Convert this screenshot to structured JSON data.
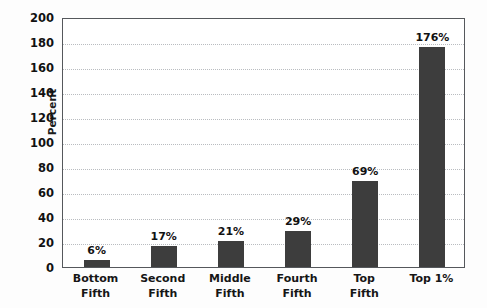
{
  "chart_data": {
    "type": "bar",
    "title": "",
    "subtitle": "",
    "xlabel": "",
    "ylabel": "Percent",
    "categories": [
      "Bottom Fifth",
      "Second Fifth",
      "Middle Fifth",
      "Fourth Fifth",
      "Top Fifth",
      "Top 1%"
    ],
    "category_lines": [
      [
        "Bottom",
        "Fifth"
      ],
      [
        "Second",
        "Fifth"
      ],
      [
        "Middle",
        "Fifth"
      ],
      [
        "Fourth",
        "Fifth"
      ],
      [
        "Top",
        "Fifth"
      ],
      [
        "Top 1%",
        ""
      ]
    ],
    "values": [
      6,
      17,
      21,
      29,
      69,
      176
    ],
    "value_labels": [
      "6%",
      "17%",
      "21%",
      "29%",
      "69%",
      "176%"
    ],
    "ylim": [
      0,
      200
    ],
    "y_ticks": [
      0,
      20,
      40,
      60,
      80,
      100,
      120,
      140,
      160,
      180,
      200
    ],
    "y_tick_labels": [
      "0",
      "20",
      "40",
      "60",
      "80",
      "100",
      "120",
      "140",
      "160",
      "180",
      "200"
    ],
    "grid": true,
    "grid_axis": "y",
    "legend": false,
    "legend_position": "none",
    "bar_color": "#3d3d3d",
    "grid_color": "#b9bcc0",
    "axis_color": "#55585c",
    "background_color": "#ffffff"
  }
}
